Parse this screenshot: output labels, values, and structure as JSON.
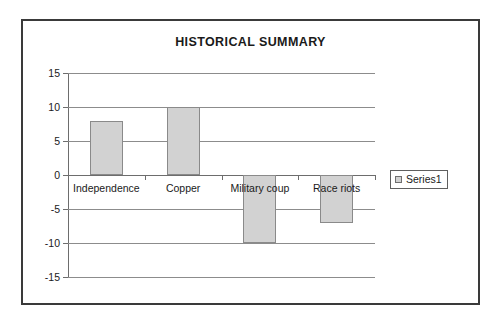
{
  "chart_data": {
    "type": "bar",
    "title": "HISTORICAL SUMMARY",
    "categories": [
      "Independence",
      "Copper",
      "Military coup",
      "Race riots"
    ],
    "values": [
      8,
      10,
      -10,
      -7
    ],
    "series": [
      {
        "name": "Series1",
        "values": [
          8,
          10,
          -10,
          -7
        ]
      }
    ],
    "xlabel": "",
    "ylabel": "",
    "ylim": [
      -15,
      15
    ],
    "ytick_labels": [
      "15",
      "10",
      "5",
      "0",
      "-5",
      "-10",
      "-15"
    ],
    "yticks": [
      15,
      10,
      5,
      0,
      -5,
      -10,
      -15
    ],
    "grid": true,
    "grid_axis": "y",
    "legend": {
      "position": "right",
      "entries": [
        "Series1"
      ]
    },
    "bar_fill_color": "#d2d2d2",
    "bar_border_color": "#8a8a8a",
    "gridline_color": "#8c8c8c",
    "axis_color": "#6d6d6d",
    "plot_background": "#ffffff",
    "frame_border_color": "#3a3a3a",
    "category_labels_position": "below-axis"
  }
}
